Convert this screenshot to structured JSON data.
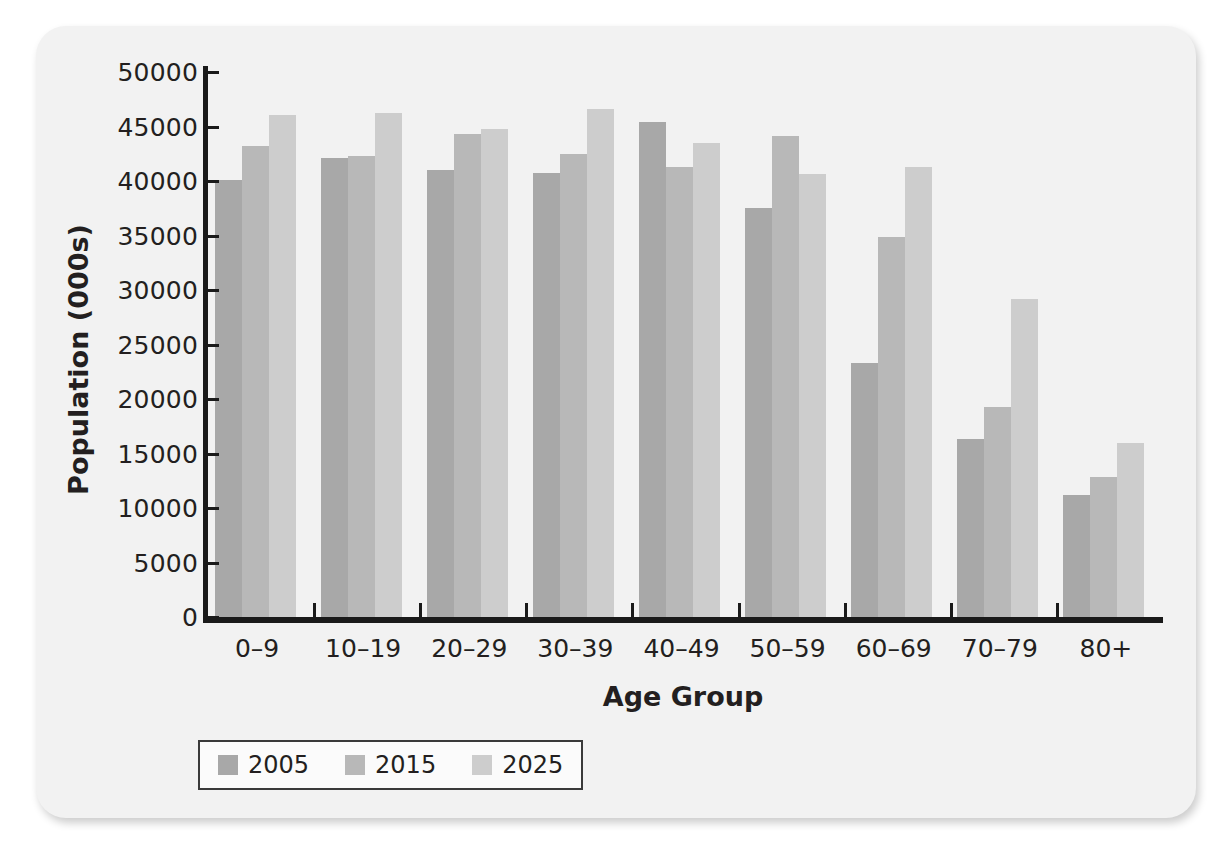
{
  "chart_data": {
    "type": "bar",
    "title": "",
    "xlabel": "Age Group",
    "ylabel": "Population (000s)",
    "categories": [
      "0–9",
      "10–19",
      "20–29",
      "30–39",
      "40–49",
      "50–59",
      "60–69",
      "70–79",
      "80+"
    ],
    "series": [
      {
        "name": "2005",
        "color": "#a8a8a8",
        "values": [
          40100,
          42100,
          41000,
          40700,
          45400,
          37500,
          23300,
          16300,
          11200
        ]
      },
      {
        "name": "2015",
        "color": "#b8b8b8",
        "values": [
          43200,
          42300,
          44300,
          42500,
          41300,
          44100,
          34900,
          19300,
          12800
        ]
      },
      {
        "name": "2025",
        "color": "#cdcdcd",
        "values": [
          46100,
          46200,
          44800,
          46600,
          43500,
          40600,
          41300,
          29200,
          16000
        ]
      }
    ],
    "ylim": [
      0,
      50000
    ],
    "yticks": [
      0,
      5000,
      10000,
      15000,
      20000,
      25000,
      30000,
      35000,
      40000,
      45000,
      50000
    ],
    "ytick_labels": [
      "0",
      "5000",
      "10000",
      "15000",
      "20000",
      "25000",
      "30000",
      "35000",
      "40000",
      "45000",
      "50000"
    ],
    "grid": false,
    "legend_position": "bottom-left"
  }
}
